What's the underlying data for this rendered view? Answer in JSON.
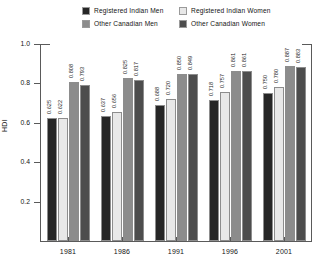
{
  "chart_data": {
    "type": "bar",
    "title": "",
    "subtitle": "",
    "xlabel": "",
    "ylabel": "HDI",
    "ylim": [
      0.0,
      1.0
    ],
    "y_ticks": [
      "0.2",
      "0.4",
      "0.6",
      "0.8",
      "1.0"
    ],
    "y_tick_values": [
      0.2,
      0.4,
      0.6,
      0.8,
      1.0
    ],
    "grid": false,
    "legend_position": "top",
    "categories": [
      "1981",
      "1986",
      "1991",
      "1996",
      "2001"
    ],
    "series": [
      {
        "name": "Registered Indian Men",
        "color": "#262626",
        "values": [
          0.625,
          0.637,
          0.688,
          0.718,
          0.75
        ],
        "labels": [
          "0.625",
          "0.637",
          "0.688",
          "0.718",
          "0.750"
        ]
      },
      {
        "name": "Registered Indian Women",
        "color": "#e8e8e8",
        "values": [
          0.622,
          0.656,
          0.72,
          0.757,
          0.78
        ],
        "labels": [
          "0.622",
          "0.656",
          "0.720",
          "0.757",
          "0.780"
        ]
      },
      {
        "name": "Other Canadian Men",
        "color": "#8c8c8c",
        "values": [
          0.808,
          0.825,
          0.85,
          0.861,
          0.887
        ],
        "labels": [
          "0.808",
          "0.825",
          "0.850",
          "0.861",
          "0.887"
        ]
      },
      {
        "name": "Other Canadian Women",
        "color": "#4d4d4d",
        "values": [
          0.793,
          0.817,
          0.849,
          0.861,
          0.883
        ],
        "labels": [
          "0.793",
          "0.817",
          "0.849",
          "0.861",
          "0.883"
        ]
      }
    ]
  },
  "legend": {
    "items": [
      {
        "label": "Registered Indian Men",
        "color": "#262626"
      },
      {
        "label": "Registered Indian Women",
        "color": "#e8e8e8"
      },
      {
        "label": "Other Canadian Men",
        "color": "#8c8c8c"
      },
      {
        "label": "Other Canadian Women",
        "color": "#4d4d4d"
      }
    ]
  },
  "axes": {
    "y_title": "HDI"
  }
}
